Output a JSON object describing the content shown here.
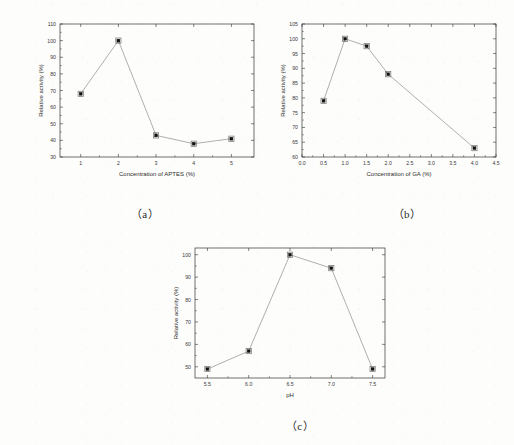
{
  "figure": {
    "background_color": "#fdfdfc",
    "ink_color": "#333333",
    "marker_color": "#111111",
    "panels": [
      {
        "caption": "（a）"
      },
      {
        "caption": "（b）"
      },
      {
        "caption": "（c）"
      }
    ]
  },
  "chart_data": [
    {
      "type": "line",
      "panel": "a",
      "title": "",
      "xlabel": "Concentration of APTES (%)",
      "ylabel": "Relative activity (%)",
      "x": [
        1,
        2,
        3,
        4,
        5
      ],
      "values": [
        68,
        100,
        43,
        38,
        41
      ],
      "xticks": [
        1,
        2,
        3,
        4,
        5
      ],
      "xtick_labels": [
        "1",
        "2",
        "3",
        "4",
        "5"
      ],
      "yticks": [
        30,
        40,
        50,
        60,
        70,
        80,
        90,
        100,
        110
      ],
      "ytick_labels": [
        "30",
        "40",
        "50",
        "60",
        "70",
        "80",
        "90",
        "100",
        "110"
      ],
      "xlim": [
        0.45,
        5.6
      ],
      "ylim": [
        30,
        110
      ],
      "grid": false,
      "legend": "none",
      "marker": "filled-square"
    },
    {
      "type": "line",
      "panel": "b",
      "title": "",
      "xlabel": "Concentration of GA (%)",
      "ylabel": "Relative activity (%)",
      "x": [
        0.5,
        1.0,
        1.5,
        2.0,
        4.0
      ],
      "values": [
        79,
        100,
        97.5,
        88,
        63
      ],
      "xticks": [
        0.0,
        0.5,
        1.0,
        1.5,
        2.0,
        2.5,
        3.0,
        3.5,
        4.0,
        4.5
      ],
      "xtick_labels": [
        "0.0",
        "0.5",
        "1.0",
        "1.5",
        "2.0",
        "2.5",
        "3.0",
        "3.5",
        "4.0",
        "4.5"
      ],
      "yticks": [
        60,
        65,
        70,
        75,
        80,
        85,
        90,
        95,
        100,
        105
      ],
      "ytick_labels": [
        "60",
        "65",
        "70",
        "75",
        "80",
        "85",
        "90",
        "95",
        "100",
        "105"
      ],
      "xlim": [
        0.0,
        4.5
      ],
      "ylim": [
        60,
        105
      ],
      "grid": false,
      "legend": "none",
      "marker": "filled-square"
    },
    {
      "type": "line",
      "panel": "c",
      "title": "",
      "xlabel": "pH",
      "ylabel": "Relative activity (%)",
      "x": [
        5.5,
        6.0,
        6.5,
        7.0,
        7.5
      ],
      "values": [
        49,
        57,
        100,
        94,
        49
      ],
      "xticks": [
        5.5,
        6.0,
        6.5,
        7.0,
        7.5
      ],
      "xtick_labels": [
        "5.5",
        "6.0",
        "6.5",
        "7.0",
        "7.5"
      ],
      "yticks": [
        50,
        60,
        70,
        80,
        90,
        100
      ],
      "ytick_labels": [
        "50",
        "60",
        "70",
        "80",
        "90",
        "100"
      ],
      "xlim": [
        5.35,
        7.65
      ],
      "ylim": [
        45,
        103
      ],
      "grid": false,
      "legend": "none",
      "marker": "filled-square"
    }
  ]
}
